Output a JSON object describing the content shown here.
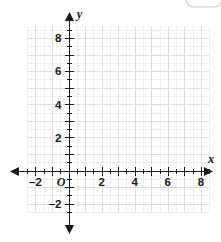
{
  "chart_data": {
    "type": "scatter",
    "title": "",
    "subtitle": "",
    "xlabel": "x",
    "ylabel": "y",
    "xlim": [
      -2.5,
      8.5
    ],
    "ylim": [
      -2.5,
      8.75
    ],
    "x_tick_labels": [
      "–2",
      "2",
      "4",
      "6",
      "8"
    ],
    "x_tick_values": [
      -2,
      2,
      4,
      6,
      8
    ],
    "y_tick_labels": [
      "8",
      "6",
      "4",
      "2",
      "–2"
    ],
    "y_tick_values": [
      8,
      6,
      4,
      2,
      -2
    ],
    "origin_label": "O",
    "minor_tick_step": 0.5,
    "major_grid_step": 1,
    "grid": true,
    "grid_color": "#e6e6e6",
    "major_grid_color": "#dedede",
    "axis_color": "#1a1a1a",
    "series": [],
    "values": [],
    "categories": [],
    "annotations": [],
    "legend": [],
    "legend_position": "none"
  },
  "axes": {
    "x_axis_name": "x",
    "y_axis_name": "y"
  },
  "artifact": {
    "name": "cropped-rounded-button"
  }
}
